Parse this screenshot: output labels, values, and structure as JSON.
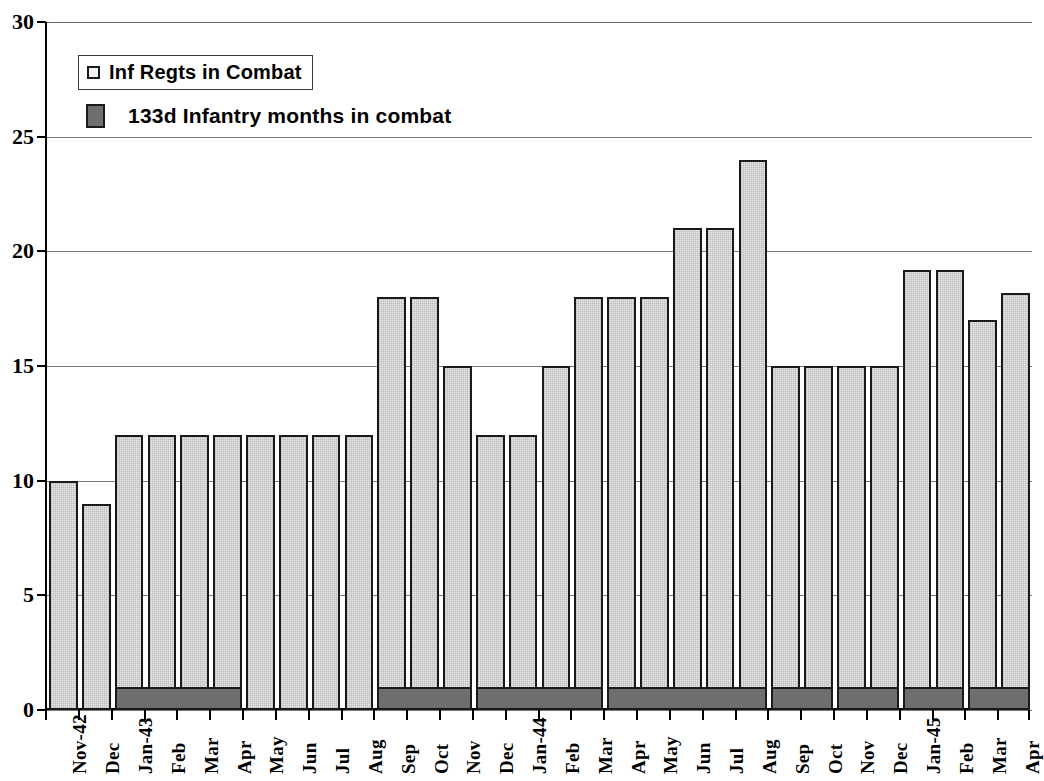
{
  "chart_data": {
    "type": "bar",
    "title": "",
    "subtitle": "",
    "xlabel": "",
    "ylabel": "",
    "ylim": [
      0,
      30
    ],
    "yticks": [
      0,
      5,
      10,
      15,
      20,
      25,
      30
    ],
    "ytick_labels": [
      "0",
      "5",
      "10",
      "15",
      "20",
      "25",
      "30"
    ],
    "grid": true,
    "legend_position": "upper-left",
    "categories": [
      "Nov-42",
      "Dec",
      "Jan-43",
      "Feb",
      "Mar",
      "Apr",
      "May",
      "Jun",
      "Jul",
      "Aug",
      "Sep",
      "Oct",
      "Nov",
      "Dec",
      "Jan-44",
      "Feb",
      "Mar",
      "Apr",
      "May",
      "Jun",
      "Jul",
      "Aug",
      "Sep",
      "Oct",
      "Nov",
      "Dec",
      "Jan-45",
      "Feb",
      "Mar",
      "Apr"
    ],
    "series": [
      {
        "name": "Inf Regts in Combat",
        "color": "#e9e9e9",
        "values": [
          10,
          9,
          12,
          12,
          12,
          12,
          12,
          12,
          12,
          12,
          18,
          18,
          15,
          12,
          12,
          15,
          18,
          18,
          18,
          21,
          21,
          24,
          15,
          15,
          15,
          15,
          19.2,
          19.2,
          17,
          18.2
        ]
      },
      {
        "name": "133d Infantry months in combat",
        "color": "#6e6e6e",
        "values": [
          0,
          0,
          1,
          1,
          1,
          1,
          0,
          0,
          0,
          0,
          1,
          1,
          1,
          1,
          1,
          1,
          1,
          1,
          1,
          1,
          1,
          1,
          1,
          1,
          1,
          1,
          1,
          1,
          1,
          1
        ],
        "spans": [
          {
            "start": 2,
            "end": 5
          },
          {
            "start": 10,
            "end": 12
          },
          {
            "start": 13,
            "end": 16
          },
          {
            "start": 17,
            "end": 21
          },
          {
            "start": 22,
            "end": 23
          },
          {
            "start": 24,
            "end": 25
          },
          {
            "start": 26,
            "end": 27
          },
          {
            "start": 28,
            "end": 29
          }
        ],
        "span_value": 1
      }
    ]
  },
  "legend": {
    "items": [
      {
        "label": "Inf Regts in Combat",
        "swatch": "light-swatch-icon"
      },
      {
        "label": "133d Infantry months in combat",
        "swatch": "dark-swatch-icon"
      }
    ]
  }
}
